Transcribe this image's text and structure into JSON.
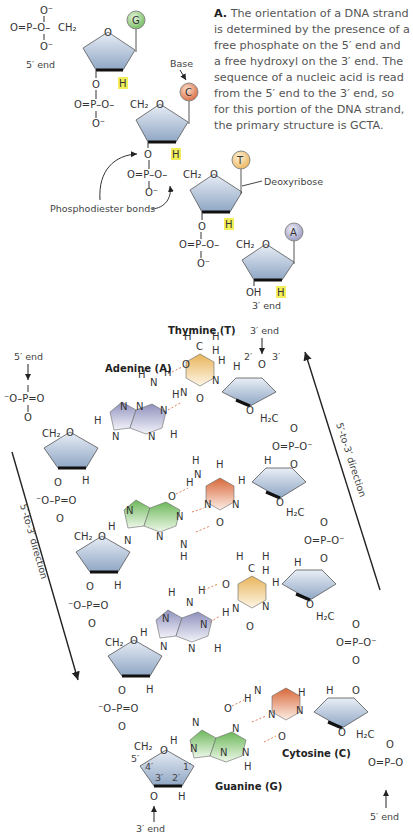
{
  "caption": {
    "letter": "A.",
    "text": "The orientation of a DNA strand is determined by the presence of a free phosphate on the 5′ end and a free hydroxyl on the 3′ end. The sequence of a nucleic acid is read from the 5′ end to the 3′ end, so for this portion of the DNA strand, the primary structure is GCTA."
  },
  "single_strand": {
    "five_prime_end": "5′ end",
    "three_prime_end": "3′ end",
    "base_label": "Base",
    "deoxyribose_label": "Deoxyribose",
    "phosphodiester_label": "Phosphodiester bonds",
    "bases": [
      {
        "letter": "G",
        "color": "#7fc46a"
      },
      {
        "letter": "C",
        "color": "#e0784a"
      },
      {
        "letter": "T",
        "color": "#f2c46a"
      },
      {
        "letter": "A",
        "color": "#a9aac8"
      }
    ],
    "atoms": {
      "O": "O",
      "O_minus": "O⁻",
      "P": "P",
      "CH2": "CH₂",
      "H": "H",
      "OH": "OH",
      "H2C": "H₂C",
      "N": "N",
      "C": "C"
    }
  },
  "double_helix": {
    "left_strand": {
      "top_label": "5′ end",
      "bottom_label": "3′ end",
      "direction_label": "5′-to-3′ direction"
    },
    "right_strand": {
      "top_label": "3′ end",
      "bottom_label": "5′ end",
      "direction_label": "5′-to-3′ direction"
    },
    "base_names": {
      "adenine": "Adenine (A)",
      "thymine": "Thymine (T)",
      "cytosine": "Cytosine (C)",
      "guanine": "Guanine (G)"
    },
    "carbon_numbers": [
      "1′",
      "2′",
      "3′",
      "4′",
      "5′"
    ],
    "colors": {
      "adenine": "#9d9fc4",
      "thymine": "#f0c674",
      "cytosine": "#df8158",
      "guanine": "#8cc97a",
      "sugar": "#b7c7dc",
      "hbond": "#e0805a",
      "highlight": "#f3ef5a"
    }
  }
}
